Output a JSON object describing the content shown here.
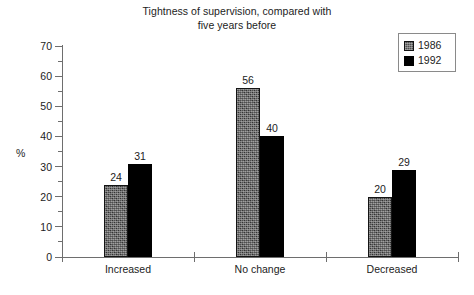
{
  "chart_data": {
    "type": "bar",
    "title": "Tightness of supervision, compared with\nfive years before",
    "xlabel": "",
    "ylabel": "%",
    "categories": [
      "Increased",
      "No change",
      "Decreased"
    ],
    "series": [
      {
        "name": "1986",
        "values": [
          24,
          56,
          20
        ],
        "color": "#4e4e4e",
        "fill": "dithered-gray"
      },
      {
        "name": "1992",
        "values": [
          31,
          40,
          29
        ],
        "color": "#000000",
        "fill": "solid-black"
      }
    ],
    "ylim": [
      0,
      70
    ],
    "y_major_ticks": [
      0,
      10,
      20,
      30,
      40,
      50,
      60,
      70
    ],
    "y_tick_labels": [
      "0",
      "10",
      "20",
      "30",
      "40",
      "50",
      "60",
      "70"
    ],
    "y_minor_ticks": [
      5,
      15,
      25,
      35,
      45,
      55,
      65
    ],
    "grid": false,
    "legend_position": "top-right",
    "data_labels": true,
    "background": "#ffffff",
    "axis_color": "#6e6e6e",
    "text_color": "#1c1c1c"
  },
  "legend": {
    "entries": [
      {
        "label": "1986"
      },
      {
        "label": "1992"
      }
    ]
  }
}
